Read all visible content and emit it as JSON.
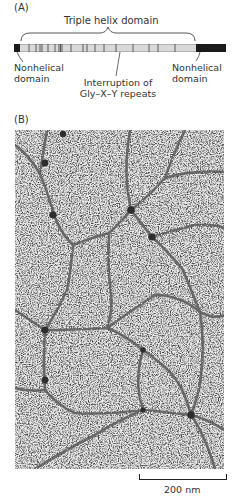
{
  "panel_a": {
    "label": "(A)",
    "title": "Triple helix domain",
    "left_annotation": [
      "Nonhelical",
      "domain"
    ],
    "middle_annotation": [
      "Interruption of",
      "Gly–X–Y repeats"
    ],
    "right_annotation": [
      "Nonhelical",
      "domain"
    ],
    "colors": {
      "bar_fill": "#d9d9d9",
      "nonhelical": "#1a1a1a",
      "stripe": "#333333"
    }
  },
  "panel_b": {
    "label": "(B)",
    "image_description": "Electron micrograph of a network of collagen fibers with dark globular nodes",
    "scale_bar": {
      "label": "200 nm"
    }
  }
}
